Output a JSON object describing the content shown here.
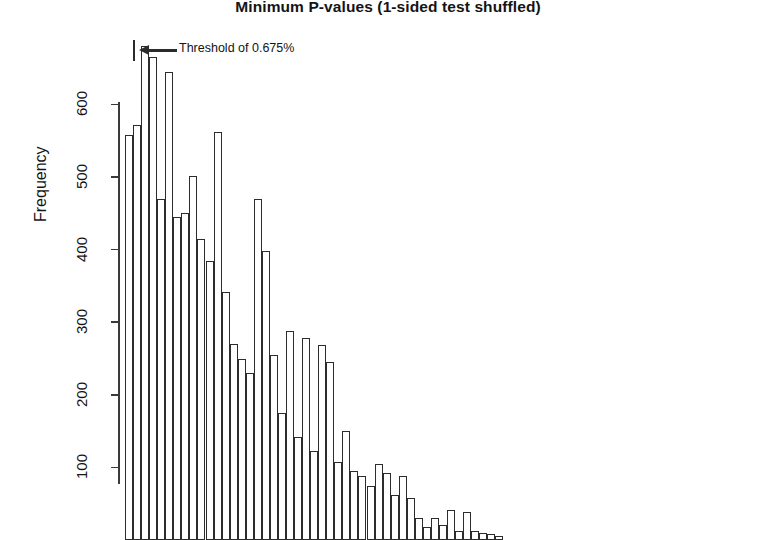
{
  "chart_data": {
    "type": "bar",
    "title": "Minimum P-values (1-sided test shuffled)",
    "xlabel": "",
    "ylabel": "Frequency",
    "ylim": [
      0,
      690
    ],
    "yticks": [
      100,
      200,
      300,
      400,
      500,
      600
    ],
    "grid": false,
    "legend": null,
    "categories": [
      "1",
      "2",
      "3",
      "4",
      "5",
      "6",
      "7",
      "8",
      "9",
      "10",
      "11",
      "12",
      "13",
      "14",
      "15",
      "16",
      "17",
      "18",
      "19",
      "20",
      "21",
      "22",
      "23",
      "24",
      "25",
      "26",
      "27",
      "28",
      "29",
      "30",
      "31",
      "32",
      "33",
      "34",
      "35",
      "36",
      "37",
      "38",
      "39",
      "40",
      "41",
      "42",
      "43",
      "44",
      "45",
      "46",
      "47"
    ],
    "values": [
      558,
      572,
      680,
      665,
      470,
      645,
      445,
      450,
      502,
      415,
      385,
      562,
      342,
      270,
      250,
      230,
      470,
      398,
      255,
      175,
      288,
      142,
      278,
      122,
      268,
      245,
      108,
      150,
      95,
      88,
      75,
      105,
      92,
      62,
      88,
      58,
      30,
      18,
      30,
      20,
      42,
      12,
      38,
      12,
      10,
      8,
      6
    ],
    "annotations": [
      {
        "name": "threshold-annotation",
        "text": "Threshold of 0.675%",
        "arrow": "left",
        "at_bar_index": 2
      }
    ]
  },
  "axis": {
    "ytick_labels": [
      "100",
      "200",
      "300",
      "400",
      "500",
      "600"
    ]
  },
  "colors": {
    "bar_stroke": "#2c2c2c",
    "bar_fill": "#ffffff",
    "axis": "#3a3a3a",
    "text": "#141414",
    "background": "#ffffff"
  }
}
